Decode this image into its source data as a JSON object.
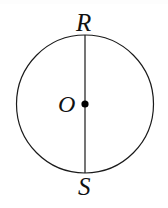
{
  "figure": {
    "kind": "geometry-diagram",
    "background_color": "#ffffff",
    "stroke_color": "#1a1a1a",
    "stroke_width": 1.2,
    "canvas": {
      "width": 168,
      "height": 208
    },
    "circle": {
      "name": "circle-O",
      "center_x": 85,
      "center_y": 104,
      "radius_x": 68.5,
      "radius_y": 69,
      "fill": "none"
    },
    "diameter": {
      "name": "segment-RS",
      "x1": 85,
      "y1": 35,
      "x2": 85,
      "y2": 173
    },
    "center_point": {
      "name": "point-O",
      "cx": 85,
      "cy": 104,
      "r": 3.6,
      "fill": "#000000"
    },
    "labels": [
      {
        "id": "R",
        "text": "R",
        "x": 86,
        "y": 22,
        "role": "top endpoint of diameter"
      },
      {
        "id": "O",
        "text": "O",
        "x": 67,
        "y": 104,
        "role": "center of circle"
      },
      {
        "id": "S",
        "text": "S",
        "x": 85,
        "y": 187,
        "role": "bottom endpoint of diameter"
      }
    ]
  },
  "chart_data": {
    "type": "diagram",
    "title": "",
    "shapes": [
      {
        "shape": "circle",
        "label": "circle with center O",
        "center": [
          85,
          104
        ],
        "radius": 69
      },
      {
        "shape": "line-segment",
        "label": "RS",
        "from": [
          85,
          35
        ],
        "to": [
          85,
          173
        ],
        "note": "vertical diameter passing through O"
      },
      {
        "shape": "point",
        "label": "O",
        "at": [
          85,
          104
        ],
        "note": "filled dot marking the center"
      }
    ],
    "point_labels": [
      "R",
      "O",
      "S"
    ]
  }
}
